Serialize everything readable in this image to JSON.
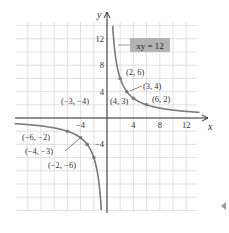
{
  "chart_data": {
    "type": "line",
    "title": "",
    "equation_label": "xy = 12",
    "xlabel": "x",
    "ylabel": "y",
    "xlim": [
      -14,
      14
    ],
    "ylim": [
      -14,
      14.5
    ],
    "grid": true,
    "grid_step": 2,
    "x_ticks": [
      {
        "value": -4,
        "label": "−4"
      },
      {
        "value": 4,
        "label": "4"
      },
      {
        "value": 8,
        "label": "8"
      },
      {
        "value": 12,
        "label": "12"
      }
    ],
    "y_ticks": [
      {
        "value": 12,
        "label": "12"
      },
      {
        "value": 8,
        "label": "8"
      },
      {
        "value": 4,
        "label": "4"
      },
      {
        "value": -4,
        "label": "−4"
      }
    ],
    "series": [
      {
        "name": "xy = 12 (branch x>0)",
        "function": "y = 12/x",
        "domain": [
          0.86,
          14
        ]
      },
      {
        "name": "xy = 12 (branch x<0)",
        "function": "y = 12/x",
        "domain": [
          -14,
          -0.86
        ]
      }
    ],
    "points": [
      {
        "x": 2,
        "y": 6,
        "label": "(2, 6)"
      },
      {
        "x": 3,
        "y": 4,
        "label": "(3, 4)"
      },
      {
        "x": 4,
        "y": 3,
        "label": "(4, 3)"
      },
      {
        "x": 6,
        "y": 2,
        "label": "(6, 2)"
      },
      {
        "x": -6,
        "y": -2,
        "label": "(−6, −2)"
      },
      {
        "x": -4,
        "y": -3,
        "label": "(−4, −3)"
      },
      {
        "x": -3,
        "y": -4,
        "label": "(−3, −4)"
      },
      {
        "x": -2,
        "y": -6,
        "label": "(−2, −6)"
      }
    ],
    "colors": {
      "curve": "#7a7a7a",
      "grid": "#d8d8d8",
      "axis": "#333333",
      "label_box": "#b3b3b3"
    }
  }
}
